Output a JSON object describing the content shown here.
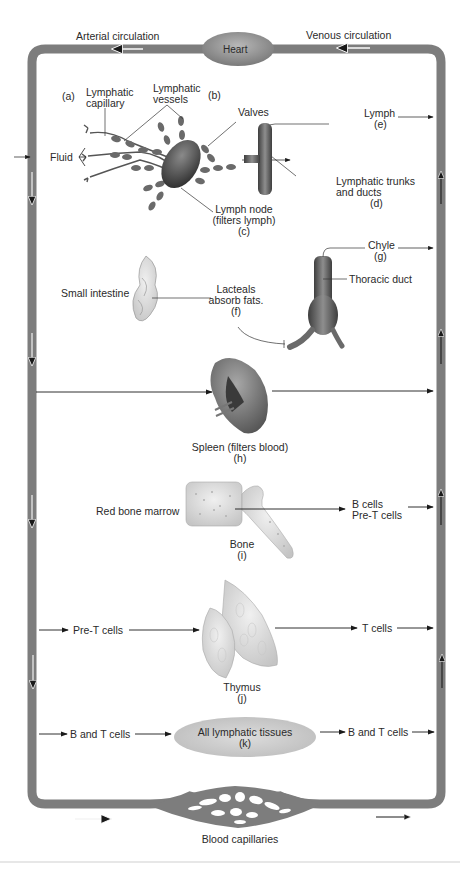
{
  "header_fragment": "…lymphatic system…",
  "top": {
    "arterial": "Arterial circulation",
    "venous": "Venous circulation",
    "heart": "Heart"
  },
  "row_a": {
    "a_tag": "(a)",
    "lymph_capillary": "Lymphatic\ncapillary",
    "lymph_cap_1": "Lymphatic",
    "lymph_cap_2": "capillary",
    "vessels_1": "Lymphatic",
    "vessels_2": "vessels",
    "b_tag": "(b)",
    "valves": "Valves",
    "fluid": "Fluid",
    "node_1": "Lymph node",
    "node_2": "(filters lymph)",
    "node_tag": "(c)",
    "lymph": "Lymph",
    "lymph_tag": "(e)",
    "trunks_1": "Lymphatic trunks",
    "trunks_2": "and ducts",
    "trunks_tag": "(d)"
  },
  "row_f": {
    "small_intestine": "Small intestine",
    "lacteals_1": "Lacteals",
    "lacteals_2": "absorb fats.",
    "lacteals_tag": "(f)",
    "chyle": "Chyle",
    "chyle_tag": "(g)",
    "thoracic": "Thoracic duct"
  },
  "row_h": {
    "spleen": "Spleen (filters blood)",
    "spleen_tag": "(h)"
  },
  "row_i": {
    "marrow": "Red bone marrow",
    "bone": "Bone",
    "bone_tag": "(i)",
    "out_1": "B cells",
    "out_2": "Pre-T cells"
  },
  "row_j": {
    "in": "Pre-T cells",
    "out": "T cells",
    "thymus": "Thymus",
    "thymus_tag": "(j)"
  },
  "row_k": {
    "in": "B and T cells",
    "tissues": "All lymphatic tissues",
    "tissues_tag": "(k)",
    "out": "B and T cells"
  },
  "bottom": {
    "capillaries": "Blood capillaries"
  },
  "colors": {
    "vessel": "#7d7d7d",
    "organ_dark": "#555555",
    "organ_light": "#d9d9d9",
    "ellipse": "#cfcfcf",
    "arrow": "#1a1a1a"
  }
}
